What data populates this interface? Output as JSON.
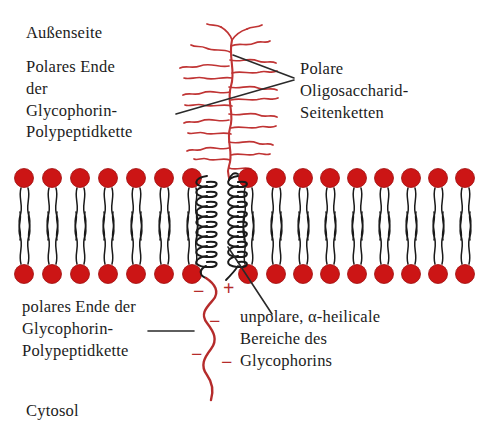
{
  "figure": {
    "background_color": "#ffffff",
    "width": 484,
    "height": 438
  },
  "colors": {
    "lipid_head": "#cc1515",
    "lipid_head_dark": "#9e0d0d",
    "polypeptide_red": "#b52b2b",
    "oligosaccharide_red": "#c03434",
    "protein_black": "#1a1a1a",
    "leader_line": "#2a2a2a",
    "text": "#1c1c1c"
  },
  "labels": {
    "outside": "Außenseite",
    "polar_end_top": "Polares Ende\nder\nGlycophorin-\nPolypeptidkette",
    "oligosaccharide": "Polare\nOligosaccharid-\nSeitenketten",
    "polar_end_bottom": "polares Ende der\nGlycophorin-\nPolypeptidkette",
    "nonpolar_regions": "unpolare, α-heilicale\nBereiche des\nGlycophorins",
    "cytosol": "Cytosol"
  },
  "charges": [
    {
      "sign": "−",
      "x": 196,
      "y": 292
    },
    {
      "sign": "+",
      "x": 226,
      "y": 289
    },
    {
      "sign": "−",
      "x": 212,
      "y": 322
    },
    {
      "sign": "−",
      "x": 194,
      "y": 355
    },
    {
      "sign": "−",
      "x": 224,
      "y": 363
    }
  ],
  "membrane": {
    "outer_leaflet_head_y": 178,
    "inner_leaflet_head_y": 274,
    "head_radius": 9.5,
    "left_head_xs": [
      24,
      52,
      80,
      108,
      136,
      164,
      192
    ],
    "right_head_xs": [
      248,
      276,
      303,
      330,
      357,
      384,
      411,
      438,
      465
    ],
    "left_head_count": 7,
    "right_head_count": 9
  },
  "protein": {
    "helix_count": 2,
    "helix_left_x": 205,
    "helix_right_x": 237,
    "helix_top_y": 176,
    "helix_bottom_y": 272,
    "helix_turns": 9
  },
  "leader_lines": [
    {
      "name": "oligosaccharide-upper",
      "x1": 294,
      "y1": 78,
      "x2": 233,
      "y2": 56
    },
    {
      "name": "oligosaccharide-lower",
      "x1": 294,
      "y1": 80,
      "x2": 176,
      "y2": 113
    },
    {
      "name": "nonpolar-regions",
      "x1": 272,
      "y1": 312,
      "x2": 228,
      "y2": 248
    },
    {
      "name": "polar-end-bottom",
      "x1": 148,
      "y1": 330,
      "x2": 192,
      "y2": 330
    }
  ]
}
